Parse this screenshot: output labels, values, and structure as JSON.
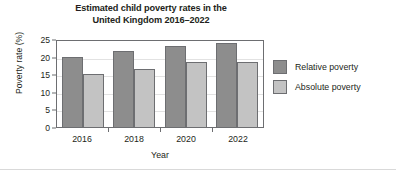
{
  "chart_data": {
    "type": "bar",
    "title": "Estimated child poverty rates in the United Kingdom 2016–2022",
    "title_lines": [
      "Estimated child poverty rates in the",
      "United Kingdom 2016–2022"
    ],
    "xlabel": "Year",
    "ylabel": "Poverty rate (%)",
    "categories": [
      "2016",
      "2018",
      "2020",
      "2022"
    ],
    "series": [
      {
        "name": "Relative poverty",
        "color": "#8d8d8d",
        "values": [
          20,
          21.5,
          23,
          24
        ]
      },
      {
        "name": "Absolute poverty",
        "color": "#c3c3c3",
        "values": [
          15,
          16.5,
          18.5,
          18.5
        ]
      }
    ],
    "ylim": [
      0,
      25
    ],
    "yticks": [
      0,
      5,
      10,
      15,
      20,
      25
    ],
    "ytick_labels": [
      "0",
      "5",
      "10",
      "15",
      "20",
      "25"
    ],
    "grid": true,
    "grid_axis": "y",
    "legend_position": "right",
    "legend": [
      "Relative poverty",
      "Absolute poverty"
    ],
    "bar_border_color": "#6d6e71",
    "axis_color": "#6d6e71",
    "background": "#ffffff"
  }
}
